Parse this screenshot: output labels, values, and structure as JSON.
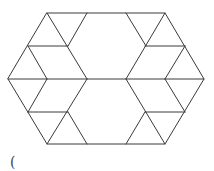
{
  "figure": {
    "type": "hexagon-tiling",
    "stroke_color": "#3a3a3a",
    "background": "#ffffff",
    "outline": [
      [
        47,
        13
      ],
      [
        165,
        13
      ],
      [
        204,
        79
      ],
      [
        165,
        144
      ],
      [
        47,
        144
      ],
      [
        8,
        79
      ]
    ],
    "segments": [
      [
        8,
        79,
        204,
        79
      ],
      [
        28,
        46,
        68,
        46
      ],
      [
        145,
        46,
        185,
        46
      ],
      [
        28,
        112,
        68,
        112
      ],
      [
        145,
        112,
        185,
        112
      ],
      [
        47,
        13,
        87,
        79
      ],
      [
        87,
        79,
        47,
        144
      ],
      [
        87,
        13,
        68,
        46
      ],
      [
        28,
        46,
        47,
        79
      ],
      [
        47,
        79,
        28,
        112
      ],
      [
        68,
        112,
        87,
        144
      ],
      [
        126,
        13,
        146,
        46
      ],
      [
        165,
        13,
        126,
        79
      ],
      [
        126,
        79,
        165,
        144
      ],
      [
        185,
        46,
        165,
        79
      ],
      [
        165,
        79,
        185,
        112
      ],
      [
        145,
        112,
        126,
        144
      ]
    ]
  },
  "caption": {
    "text": "("
  }
}
